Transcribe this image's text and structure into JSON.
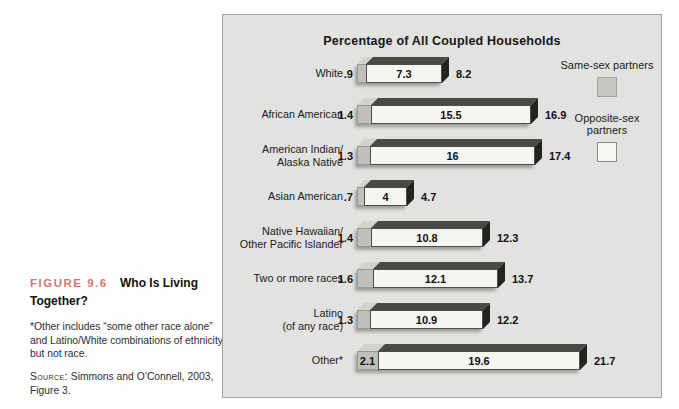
{
  "caption": {
    "figure_label": "FIGURE 9.6",
    "figure_title": "Who Is Living Together?",
    "note": "*Other includes “some other race alone” and Latino/White combinations of ethnicity but not race.",
    "source_label": "Source:",
    "source_text": "Simmons and O’Connell, 2003, Figure 3."
  },
  "colors": {
    "panel_background": "#e2e2e0",
    "same_sex_fill": "#c0c0ba",
    "opposite_sex_fill": "#f5f5f1",
    "bar_top_face": "#4a4946",
    "bar_end_cap": "#232321",
    "figure_label_red": "#cb7a70"
  },
  "chart_data": {
    "type": "bar",
    "orientation": "horizontal",
    "title": "Percentage of All Coupled Households",
    "legend": [
      "Same-sex partners",
      "Opposite-sex partners"
    ],
    "legend_position": "top-right",
    "categories": [
      "White",
      "African American",
      "American Indian/\nAlaska Native",
      "Asian American",
      "Native Hawaiian/\nOther Pacific Islander",
      "Two or more races",
      "Latino\n(of any race)",
      "Other*"
    ],
    "series": [
      {
        "name": "Same-sex partners",
        "values": [
          0.9,
          1.4,
          1.3,
          0.7,
          1.4,
          1.6,
          1.3,
          2.1
        ]
      },
      {
        "name": "Opposite-sex partners",
        "values": [
          7.3,
          15.5,
          16,
          4,
          10.8,
          12.1,
          10.9,
          19.6
        ]
      }
    ],
    "totals": [
      8.2,
      16.9,
      17.4,
      4.7,
      12.3,
      13.7,
      12.2,
      21.7
    ],
    "value_labels": {
      "same_sex": [
        ".9",
        "1.4",
        "1.3",
        ".7",
        "1.4",
        "1.6",
        "1.3",
        "2.1"
      ],
      "opposite_sex": [
        "7.3",
        "15.5",
        "16",
        "4",
        "10.8",
        "12.1",
        "10.9",
        "19.6"
      ],
      "totals": [
        "8.2",
        "16.9",
        "17.4",
        "4.7",
        "12.3",
        "13.7",
        "12.2",
        "21.7"
      ]
    }
  }
}
